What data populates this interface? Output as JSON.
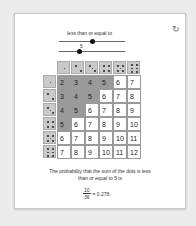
{
  "slider_top": {
    "label": "less than or equal to",
    "position_pct": 50
  },
  "slider_bottom": {
    "value_label": "5",
    "position_pct": 30
  },
  "reset_icon": "↻",
  "threshold": 5,
  "die_faces": [
    1,
    2,
    3,
    4,
    5,
    6
  ],
  "table": [
    [
      2,
      3,
      4,
      5,
      6,
      7
    ],
    [
      3,
      4,
      5,
      6,
      7,
      8
    ],
    [
      4,
      5,
      6,
      7,
      8,
      9
    ],
    [
      5,
      6,
      7,
      8,
      9,
      10
    ],
    [
      6,
      7,
      8,
      9,
      10,
      11
    ],
    [
      7,
      8,
      9,
      10,
      11,
      12
    ]
  ],
  "caption": "The probability that the sum of the dots is less than or equal to 5 is",
  "fraction": {
    "numerator": "10",
    "denominator": "36",
    "result": "= 0.278."
  },
  "colors": {
    "highlight": "#9a9a9a",
    "die": "#c9c9c9"
  }
}
